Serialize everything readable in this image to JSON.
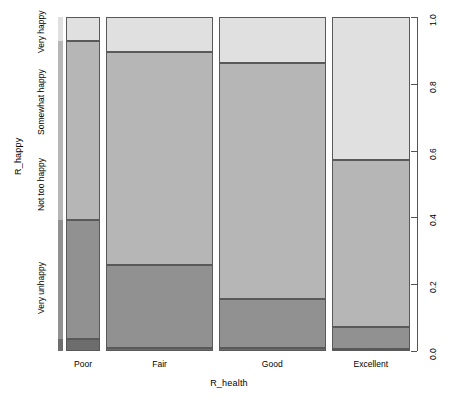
{
  "chart_data": {
    "type": "bar",
    "subtype": "mosaic-spineplot",
    "title": "",
    "xlabel": "R_health",
    "ylabel": "R_happy",
    "grid": false,
    "legend": "none",
    "categories": [
      "Poor",
      "Fair",
      "Good",
      "Excellent"
    ],
    "y_categories": [
      "Very unhappy",
      "Not too happy",
      "Somewhat happy",
      "Very happy"
    ],
    "y_right_ticks": [
      "0.0",
      "0.2",
      "0.4",
      "0.6",
      "0.8",
      "1.0"
    ],
    "ylim": [
      0.0,
      1.0
    ],
    "column_widths": [
      0.099,
      0.309,
      0.309,
      0.227
    ],
    "series": [
      {
        "name": "Very happy",
        "values": [
          0.072,
          0.105,
          0.137,
          0.428
        ]
      },
      {
        "name": "Somewhat happy",
        "values": [
          0.536,
          0.639,
          0.707,
          0.5
        ]
      },
      {
        "name": "Not too happy",
        "values": [
          0.355,
          0.247,
          0.147,
          0.066
        ]
      },
      {
        "name": "Very unhappy",
        "values": [
          0.037,
          0.009,
          0.009,
          0.006
        ]
      }
    ],
    "colors": {
      "very_happy": "#e0e0e0",
      "somewhat_happy": "#b6b6b6",
      "not_too_happy": "#919191",
      "very_unhappy": "#6d6d6d",
      "border": "#595959",
      "axis": "#555555"
    }
  },
  "axes": {
    "y_title": "R_happy",
    "x_title": "R_health",
    "y_categories": [
      {
        "label": "Very unhappy",
        "center": 0.186
      },
      {
        "label": "Not too happy",
        "center": 0.5
      },
      {
        "label": "Somewhat happy",
        "center": 0.735
      },
      {
        "label": "Very happy",
        "center": 0.955
      }
    ],
    "x_categories": [
      {
        "label": "Poor",
        "center": 0.111
      },
      {
        "label": "Fair",
        "center": 0.35
      },
      {
        "label": "Good",
        "center": 0.668
      },
      {
        "label": "Excellent",
        "center": 0.902
      }
    ],
    "right_ticks": [
      {
        "label": "1.0",
        "value": 1.0
      },
      {
        "label": "0.8",
        "value": 0.8
      },
      {
        "label": "0.6",
        "value": 0.6
      },
      {
        "label": "0.4",
        "value": 0.4
      },
      {
        "label": "0.2",
        "value": 0.2
      },
      {
        "label": "0.0",
        "value": 0.0
      }
    ]
  },
  "spine": {
    "segments": [
      {
        "name": "very-happy",
        "frac": 0.072
      },
      {
        "name": "somewhat-happy",
        "frac": 0.536
      },
      {
        "name": "not-too-happy",
        "frac": 0.355
      },
      {
        "name": "very-unhappy",
        "frac": 0.037
      }
    ]
  }
}
